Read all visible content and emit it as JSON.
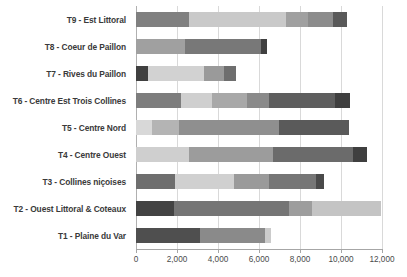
{
  "chart_data": {
    "type": "bar",
    "orientation": "horizontal",
    "stacked": true,
    "title": "",
    "subtitle": "",
    "xlabel": "",
    "ylabel": "",
    "xlim": [
      0,
      12000
    ],
    "ylim": null,
    "grid": true,
    "legend": null,
    "legend_position": "none",
    "xticks": [
      0,
      2000,
      4000,
      6000,
      8000,
      10000,
      12000
    ],
    "xtick_labels": [
      "0",
      "2,000",
      "4,000",
      "6,000",
      "8,000",
      "10,000",
      "12,000"
    ],
    "categories": [
      "T9 - Est Littoral",
      "T8 - Coeur de Paillon",
      "T7 - Rives du Paillon",
      "T6 - Centre Est Trois Collines",
      "T5 - Centre Nord",
      "T4 - Centre Ouest",
      "T3 - Collines niçoises",
      "T2 - Ouest Littoral & Coteaux",
      "T1 - Plaine du Var"
    ],
    "palette": {
      "s1": "#808080",
      "s2": "#c9c9c9",
      "s3": "#a0a0a0",
      "s4": "#8c8c8c",
      "s5": "#595959",
      "s6": "#404040",
      "s7": "#e0e0e0"
    },
    "rows": [
      {
        "category": "T9 - Est Littoral",
        "total": 10300,
        "segments": [
          {
            "value": 2600,
            "color": "#808080"
          },
          {
            "value": 4700,
            "color": "#c9c9c9"
          },
          {
            "value": 1100,
            "color": "#a0a0a0"
          },
          {
            "value": 1200,
            "color": "#8c8c8c"
          },
          {
            "value": 700,
            "color": "#595959"
          }
        ]
      },
      {
        "category": "T8 - Coeur de Paillon",
        "total": 6400,
        "segments": [
          {
            "value": 2400,
            "color": "#a0a0a0"
          },
          {
            "value": 3700,
            "color": "#787878"
          },
          {
            "value": 300,
            "color": "#404040"
          }
        ]
      },
      {
        "category": "T7 - Rives du Paillon",
        "total": 4900,
        "segments": [
          {
            "value": 600,
            "color": "#404040"
          },
          {
            "value": 2700,
            "color": "#d2d2d2"
          },
          {
            "value": 1000,
            "color": "#9a9a9a"
          },
          {
            "value": 600,
            "color": "#6e6e6e"
          }
        ]
      },
      {
        "category": "T6 - Centre Est Trois Collines",
        "total": 10450,
        "segments": [
          {
            "value": 2200,
            "color": "#7d7d7d"
          },
          {
            "value": 1500,
            "color": "#cfcfcf"
          },
          {
            "value": 1700,
            "color": "#a8a8a8"
          },
          {
            "value": 1100,
            "color": "#8a8a8a"
          },
          {
            "value": 3200,
            "color": "#5e5e5e"
          },
          {
            "value": 750,
            "color": "#3f3f3f"
          }
        ]
      },
      {
        "category": "T5 - Centre Nord",
        "total": 10400,
        "segments": [
          {
            "value": 800,
            "color": "#d8d8d8"
          },
          {
            "value": 1300,
            "color": "#b4b4b4"
          },
          {
            "value": 4900,
            "color": "#8f8f8f"
          },
          {
            "value": 3400,
            "color": "#5a5a5a"
          }
        ]
      },
      {
        "category": "T4 - Centre Ouest",
        "total": 11250,
        "segments": [
          {
            "value": 2600,
            "color": "#cfcfcf"
          },
          {
            "value": 4100,
            "color": "#9c9c9c"
          },
          {
            "value": 3900,
            "color": "#6b6b6b"
          },
          {
            "value": 650,
            "color": "#3f3f3f"
          }
        ]
      },
      {
        "category": "T3 - Collines niçoises",
        "total": 9150,
        "segments": [
          {
            "value": 1900,
            "color": "#6e6e6e"
          },
          {
            "value": 2900,
            "color": "#d0d0d0"
          },
          {
            "value": 1700,
            "color": "#9a9a9a"
          },
          {
            "value": 2300,
            "color": "#767676"
          },
          {
            "value": 350,
            "color": "#4a4a4a"
          }
        ]
      },
      {
        "category": "T2 - Ouest Littoral & Coteaux",
        "total": 11950,
        "segments": [
          {
            "value": 1850,
            "color": "#434343"
          },
          {
            "value": 5600,
            "color": "#757575"
          },
          {
            "value": 1150,
            "color": "#9d9d9d"
          },
          {
            "value": 3350,
            "color": "#c4c4c4"
          }
        ]
      },
      {
        "category": "T1 - Plaine du Var",
        "total": 6600,
        "segments": [
          {
            "value": 3100,
            "color": "#4f4f4f"
          },
          {
            "value": 3200,
            "color": "#8a8a8a"
          },
          {
            "value": 300,
            "color": "#cbcbcb"
          }
        ]
      }
    ]
  }
}
